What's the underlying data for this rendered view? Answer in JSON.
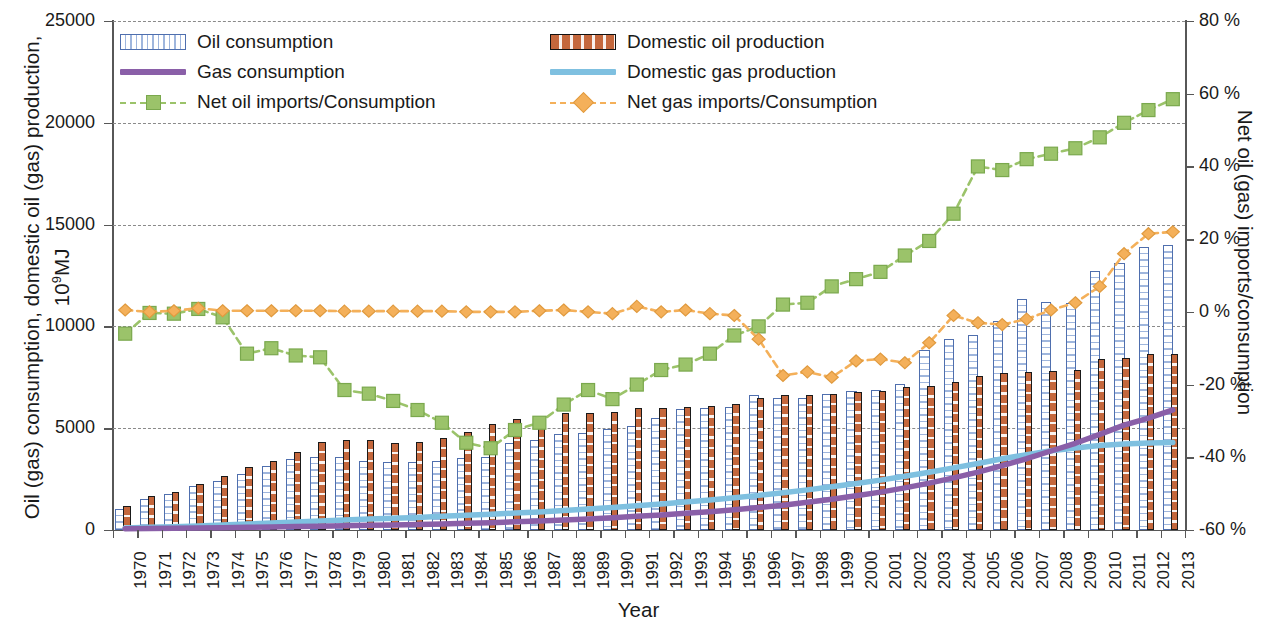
{
  "chart_data": {
    "type": "bar",
    "title": "",
    "xlabel": "Year",
    "ylabel": "Oil (gas) consumption, domestic oil (gas) production, 10⁹MJ",
    "ylabel_right": "Net oil (gas) imports/consumption",
    "ylim": [
      0,
      25000
    ],
    "ylim_right": [
      -60,
      80
    ],
    "yticks": [
      "0",
      "5000",
      "10000",
      "15000",
      "20000",
      "25000"
    ],
    "yticks_right": [
      "-60 %",
      "-40 %",
      "-20 %",
      "0 %",
      "20 %",
      "40 %",
      "60 %",
      "80 %"
    ],
    "grid": true,
    "legend_position": "top-left",
    "categories": [
      "1970",
      "1971",
      "1972",
      "1973",
      "1974",
      "1975",
      "1976",
      "1977",
      "1978",
      "1979",
      "1980",
      "1981",
      "1982",
      "1983",
      "1984",
      "1985",
      "1986",
      "1987",
      "1988",
      "1989",
      "1990",
      "1991",
      "1992",
      "1993",
      "1994",
      "1995",
      "1996",
      "1997",
      "1998",
      "1999",
      "2000",
      "2001",
      "2002",
      "2003",
      "2004",
      "2005",
      "2006",
      "2007",
      "2008",
      "2009",
      "2010",
      "2011",
      "2012",
      "2013"
    ],
    "series": [
      {
        "name": "Oil consumption",
        "kind": "bar",
        "axis": "left",
        "color": "#4f6fae",
        "values": [
          1050,
          1500,
          1750,
          2150,
          2400,
          2750,
          3150,
          3500,
          3600,
          3600,
          3400,
          3350,
          3350,
          3400,
          3550,
          3600,
          4250,
          4400,
          4700,
          4750,
          4950,
          5100,
          5500,
          5950,
          6000,
          6050,
          6650,
          6500,
          6500,
          6700,
          6850,
          6900,
          7150,
          8850,
          9400,
          9600,
          10250,
          11350,
          11200,
          11150,
          12700,
          13100,
          13900,
          14000
        ],
        "note": "blue hatched outline bars (approximate read-off)"
      },
      {
        "name": "Domestic oil production",
        "kind": "bar",
        "axis": "left",
        "color": "#c4673c",
        "values": [
          1200,
          1650,
          1850,
          2250,
          2650,
          3100,
          3400,
          3850,
          4300,
          4400,
          4400,
          4250,
          4300,
          4500,
          4800,
          5200,
          5450,
          5550,
          5750,
          5750,
          5800,
          6000,
          6000,
          6050,
          6100,
          6200,
          6500,
          6650,
          6650,
          6700,
          6800,
          6850,
          7000,
          7050,
          7250,
          7550,
          7700,
          7750,
          7800,
          7850,
          8400,
          8450,
          8650,
          8650
        ],
        "note": "orange dotted bars"
      },
      {
        "name": "Gas consumption",
        "kind": "line",
        "axis": "left",
        "color": "#8a5fa8",
        "values": [
          60,
          70,
          80,
          95,
          110,
          130,
          150,
          170,
          190,
          210,
          230,
          250,
          270,
          300,
          330,
          360,
          400,
          440,
          490,
          540,
          600,
          670,
          740,
          820,
          900,
          990,
          1100,
          1220,
          1360,
          1510,
          1680,
          1860,
          2070,
          2300,
          2560,
          2840,
          3160,
          3500,
          3880,
          4260,
          4700,
          5150,
          5500,
          5900
        ]
      },
      {
        "name": "Domestic gas production",
        "kind": "line",
        "axis": "left",
        "color": "#7fc0e0",
        "values": [
          100,
          130,
          160,
          200,
          240,
          290,
          340,
          390,
          440,
          490,
          540,
          580,
          620,
          670,
          720,
          770,
          830,
          890,
          960,
          1030,
          1110,
          1190,
          1280,
          1370,
          1470,
          1580,
          1700,
          1830,
          1970,
          2120,
          2280,
          2450,
          2640,
          2840,
          3050,
          3270,
          3500,
          3700,
          3890,
          4030,
          4150,
          4220,
          4270,
          4300
        ]
      },
      {
        "name": "Net oil imports/Consumption",
        "kind": "line-marker",
        "marker": "square",
        "axis": "right",
        "color": "#9bc36a",
        "values": [
          -6.0,
          -0.3,
          -0.5,
          0.8,
          -1.5,
          -11.5,
          -10.0,
          -12.0,
          -12.5,
          -21.5,
          -22.5,
          -24.5,
          -27.0,
          -30.5,
          -36.0,
          -37.5,
          -32.5,
          -30.5,
          -25.5,
          -21.5,
          -24.0,
          -20.0,
          -16.0,
          -14.5,
          -11.5,
          -6.5,
          -4.0,
          2.0,
          2.5,
          7.0,
          9.0,
          11.0,
          15.5,
          19.5,
          27.0,
          40.0,
          39.0,
          42.0,
          43.5,
          45.0,
          48.0,
          52.0,
          55.5,
          58.5
        ]
      },
      {
        "name": "Net gas imports/Consumption",
        "kind": "line-marker",
        "marker": "diamond",
        "axis": "right",
        "color": "#f4b05a",
        "values": [
          0.5,
          0.0,
          0.3,
          1.0,
          0.3,
          0.3,
          0.3,
          0.3,
          0.3,
          0.2,
          0.2,
          0.2,
          0.2,
          0.2,
          0.0,
          0.0,
          0.0,
          0.3,
          0.5,
          0.0,
          -0.5,
          1.5,
          0.0,
          0.5,
          -0.5,
          -1.0,
          -7.5,
          -17.5,
          -16.5,
          -18.0,
          -13.5,
          -13.0,
          -14.0,
          -8.5,
          -1.0,
          -3.0,
          -3.5,
          -2.0,
          0.5,
          2.5,
          7.0,
          16.0,
          21.5,
          22.0
        ]
      }
    ]
  },
  "legend": {
    "items": [
      {
        "label": "Oil consumption",
        "swatch": "bar-blue-hatch-icon"
      },
      {
        "label": "Domestic oil production",
        "swatch": "bar-orange-dot-icon"
      },
      {
        "label": "Gas consumption",
        "swatch": "line-purple-icon"
      },
      {
        "label": "Domestic gas production",
        "swatch": "line-lightblue-icon"
      },
      {
        "label": "Net oil imports/Consumption",
        "swatch": "dashed-green-square-icon"
      },
      {
        "label": "Net gas imports/Consumption",
        "swatch": "dashed-orange-diamond-icon"
      }
    ]
  },
  "colors": {
    "oil_consumption": "#4f6fae",
    "oil_production": "#c4673c",
    "gas_consumption": "#8a5fa8",
    "gas_production": "#7fc0e0",
    "net_oil": "#9bc36a",
    "net_gas": "#f4b05a",
    "axis": "#575757",
    "grid": "#8a8a8a"
  }
}
